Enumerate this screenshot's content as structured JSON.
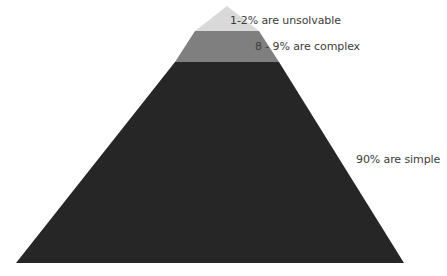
{
  "diagram": {
    "type": "pyramid",
    "tiers": [
      {
        "label": "1-2% are unsolvable",
        "color": "#d9d9d9",
        "position": "top"
      },
      {
        "label": "8 - 9% are complex",
        "color": "#7f7f7f",
        "position": "middle"
      },
      {
        "label": "90% are simple",
        "color": "#262626",
        "position": "bottom"
      }
    ]
  }
}
